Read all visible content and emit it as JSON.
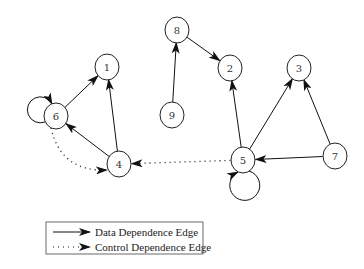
{
  "diagram": {
    "type": "program-dependence-graph",
    "nodes": [
      {
        "id": "1",
        "label": "1",
        "x": 107,
        "y": 67
      },
      {
        "id": "2",
        "label": "2",
        "x": 230,
        "y": 68
      },
      {
        "id": "3",
        "label": "3",
        "x": 299,
        "y": 68
      },
      {
        "id": "4",
        "label": "4",
        "x": 119,
        "y": 164
      },
      {
        "id": "5",
        "label": "5",
        "x": 243,
        "y": 160
      },
      {
        "id": "6",
        "label": "6",
        "x": 56,
        "y": 116
      },
      {
        "id": "7",
        "label": "7",
        "x": 335,
        "y": 156
      },
      {
        "id": "8",
        "label": "8",
        "x": 177,
        "y": 30
      },
      {
        "id": "9",
        "label": "9",
        "x": 172,
        "y": 115
      }
    ],
    "edges": [
      {
        "from": "6",
        "to": "1",
        "kind": "data"
      },
      {
        "from": "4",
        "to": "1",
        "kind": "data"
      },
      {
        "from": "4",
        "to": "6",
        "kind": "data"
      },
      {
        "from": "6",
        "to": "6",
        "kind": "data",
        "self_loop": true
      },
      {
        "from": "6",
        "to": "4",
        "kind": "control"
      },
      {
        "from": "9",
        "to": "8",
        "kind": "data"
      },
      {
        "from": "8",
        "to": "2",
        "kind": "data"
      },
      {
        "from": "5",
        "to": "2",
        "kind": "data"
      },
      {
        "from": "5",
        "to": "3",
        "kind": "data"
      },
      {
        "from": "7",
        "to": "3",
        "kind": "data"
      },
      {
        "from": "7",
        "to": "5",
        "kind": "data"
      },
      {
        "from": "5",
        "to": "5",
        "kind": "data",
        "self_loop": true
      },
      {
        "from": "5",
        "to": "4",
        "kind": "control"
      }
    ]
  },
  "legend": {
    "items": [
      {
        "kind": "data",
        "label": "Data Dependence Edge"
      },
      {
        "kind": "control",
        "label": "Control Dependence Edge"
      }
    ]
  }
}
